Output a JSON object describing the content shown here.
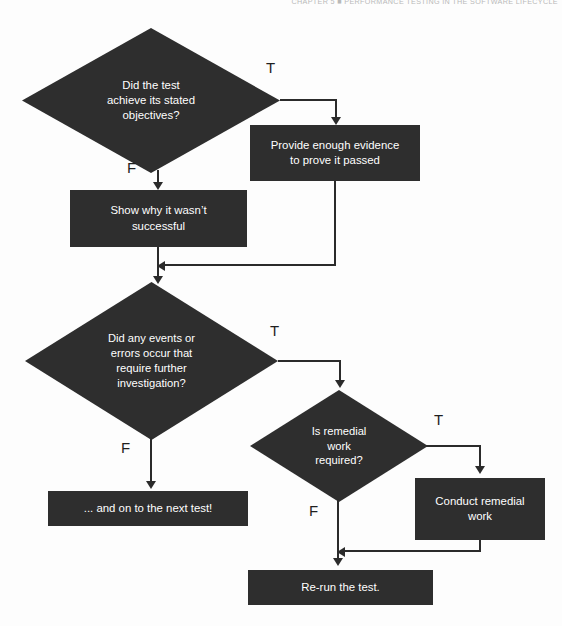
{
  "page": {
    "running_head": "CHAPTER 5 ■ PERFORMANCE TESTING IN THE SOFTWARE LIFECYCLE",
    "caption": "",
    "colors": {
      "node_fill": "#2e2e2e",
      "node_text": "#ffffff",
      "connector": "#2b2b2b",
      "background": "#fdfdfd"
    }
  },
  "flowchart": {
    "type": "flowchart",
    "nodes": [
      {
        "id": "d1",
        "shape": "decision",
        "text": "Did the test achieve its stated objectives?",
        "lines": [
          "Did the test",
          "achieve its stated",
          "objectives?"
        ]
      },
      {
        "id": "b1",
        "shape": "process",
        "text": "Provide enough evidence to prove it passed",
        "lines": [
          "Provide enough evidence",
          "to prove it passed"
        ]
      },
      {
        "id": "b2",
        "shape": "process",
        "text": "Show why it wasn’t successful",
        "lines": [
          "Show why it wasn’t",
          "successful"
        ]
      },
      {
        "id": "d2",
        "shape": "decision",
        "text": "Did any events or errors occur that require further investigation?",
        "lines": [
          "Did any events or",
          "errors occur that",
          "require further",
          "investigation?"
        ]
      },
      {
        "id": "d3",
        "shape": "decision",
        "text": "Is remedial work required?",
        "lines": [
          "Is remedial",
          "work",
          "required?"
        ]
      },
      {
        "id": "b3",
        "shape": "process",
        "text": "Conduct remedial work",
        "lines": [
          "Conduct remedial",
          "work"
        ]
      },
      {
        "id": "b4",
        "shape": "process",
        "text": "... and on to the next test!",
        "lines": [
          "... and on to the next test!"
        ]
      },
      {
        "id": "b5",
        "shape": "process",
        "text": "Re-run the test.",
        "lines": [
          "Re-run the test."
        ]
      }
    ],
    "branch_labels": {
      "d1_true": "T",
      "d1_false": "F",
      "d2_true": "T",
      "d2_false": "F",
      "d3_true": "T",
      "d3_false": "F"
    },
    "edges": [
      {
        "from": "d1",
        "to": "b1",
        "label": "T"
      },
      {
        "from": "d1",
        "to": "b2",
        "label": "F"
      },
      {
        "from": "b1",
        "to": "d2",
        "label": ""
      },
      {
        "from": "b2",
        "to": "d2",
        "label": ""
      },
      {
        "from": "d2",
        "to": "d3",
        "label": "T"
      },
      {
        "from": "d2",
        "to": "b4",
        "label": "F"
      },
      {
        "from": "d3",
        "to": "b3",
        "label": "T"
      },
      {
        "from": "d3",
        "to": "b5",
        "label": "F"
      },
      {
        "from": "b3",
        "to": "b5",
        "label": ""
      }
    ]
  }
}
